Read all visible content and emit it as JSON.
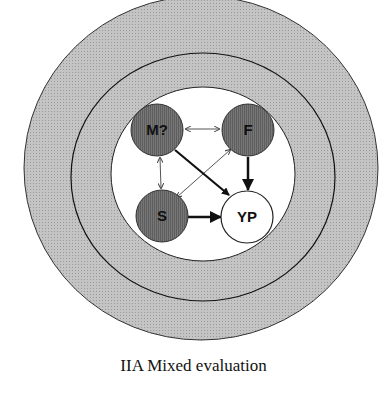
{
  "figure": {
    "caption": "IIA Mixed evaluation",
    "colors": {
      "outer_ring": "#bdbdbd",
      "ring_line": "#1a1a1a",
      "inner_field": "#ffffff",
      "dark_node": "#6e6e6e",
      "light_node": "#ffffff",
      "arrow": "#111111",
      "thin_arrow": "#555555"
    },
    "rings": [
      {
        "name": "outer-ring",
        "cx": 201,
        "cy": 168,
        "rx": 177,
        "ry": 172
      },
      {
        "name": "middle-ring",
        "cx": 203,
        "cy": 177,
        "rx": 132,
        "ry": 124
      },
      {
        "name": "inner-field",
        "cx": 203,
        "cy": 174,
        "rx": 92,
        "ry": 87
      }
    ],
    "nodes": [
      {
        "id": "M",
        "label": "M?",
        "cx": 157,
        "cy": 130,
        "r": 26,
        "style": "dark"
      },
      {
        "id": "F",
        "label": "F",
        "cx": 248,
        "cy": 130,
        "r": 26,
        "style": "dark"
      },
      {
        "id": "S",
        "label": "S",
        "cx": 162,
        "cy": 216,
        "r": 26,
        "style": "dark"
      },
      {
        "id": "YP",
        "label": "YP",
        "cx": 247,
        "cy": 216,
        "r": 26,
        "style": "light"
      }
    ],
    "edges": [
      {
        "from": "M",
        "to": "F",
        "type": "bidirectional-thin"
      },
      {
        "from": "M",
        "to": "S",
        "type": "bidirectional-thin"
      },
      {
        "from": "F",
        "to": "S",
        "type": "bidirectional-thin"
      },
      {
        "from": "M",
        "to": "YP",
        "type": "directed-bold"
      },
      {
        "from": "F",
        "to": "YP",
        "type": "directed-bold"
      },
      {
        "from": "S",
        "to": "YP",
        "type": "directed-bold"
      }
    ]
  }
}
